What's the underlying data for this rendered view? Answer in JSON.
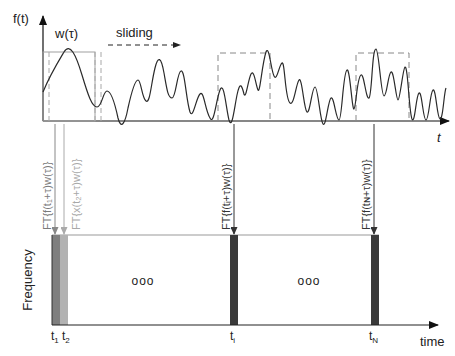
{
  "top_panel": {
    "y_axis_label": "f(t)",
    "x_axis_label": "t",
    "window_label": "w(τ)",
    "sliding_label": "sliding"
  },
  "transforms": [
    {
      "label": "FT{f(t₁+τ)w(τ)}",
      "color": "#8a8a8a"
    },
    {
      "label": "FT{x(t₂+τ)w(τ)}",
      "color": "#b0b0b0"
    },
    {
      "label": "FT{f(tᵢ+τ)w(τ)}",
      "color": "#333333"
    },
    {
      "label": "FT{f(tɴ+τ)w(τ)}",
      "color": "#333333"
    }
  ],
  "bottom_panel": {
    "y_axis_label": "Frequency",
    "x_axis_label": "time",
    "ellipsis_1": "ooo",
    "ellipsis_2": "ooo",
    "ticks": [
      {
        "main": "t",
        "sub": "1"
      },
      {
        "main": "t",
        "sub": "2"
      },
      {
        "main": "t",
        "sub": "i"
      },
      {
        "main": "t",
        "sub": "N"
      }
    ]
  },
  "colors": {
    "signal": "#2a2a2a",
    "window_solid": "#9a9a9a",
    "window_dashed": "#8c8c8c",
    "bar_t1": "#7f7f7f",
    "bar_t2": "#b2b2b2",
    "bar_ti": "#3a3a3a",
    "bar_tN": "#3a3a3a"
  }
}
